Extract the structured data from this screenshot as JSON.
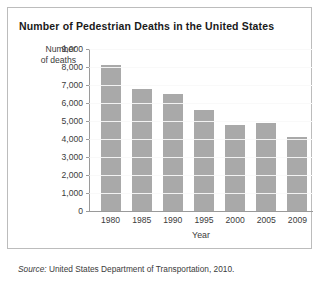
{
  "chart_data": {
    "type": "bar",
    "title": "Number of Pedestrian Deaths in the United States",
    "xlabel": "Year",
    "ylabel": "Number of deaths",
    "ylabel_line1": "Number",
    "ylabel_line2": "of deaths",
    "categories": [
      "1980",
      "1985",
      "1990",
      "1995",
      "2000",
      "2005",
      "2009"
    ],
    "values": [
      8100,
      6800,
      6500,
      5600,
      4800,
      4900,
      4100
    ],
    "ylim": [
      0,
      9000
    ],
    "ytick_step": 1000,
    "ytick_labels": [
      "9,000",
      "8,000",
      "7,000",
      "6,000",
      "5,000",
      "4,000",
      "3,000",
      "2,000",
      "1,000",
      "0"
    ],
    "ytick_values": [
      9000,
      8000,
      7000,
      6000,
      5000,
      4000,
      3000,
      2000,
      1000,
      0
    ],
    "grid": true,
    "legend": "none",
    "bar_color": "#a9a9a9",
    "grid_color": "#d5d5d5",
    "axis_color": "#9a9a9a"
  },
  "source": {
    "prefix": "Source:",
    "text": "United States Department of Transportation, 2010."
  }
}
